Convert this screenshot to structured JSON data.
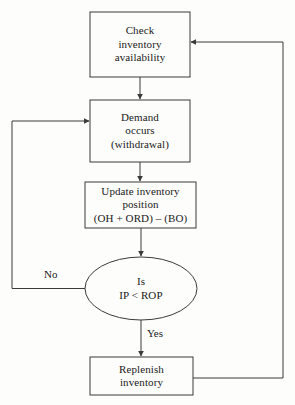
{
  "diagram": {
    "type": "flowchart",
    "background_color": "#fdfdfb",
    "line_color": "#3a3a3a",
    "text_color": "#1a1a1a",
    "nodes": [
      {
        "id": "check",
        "shape": "rectangle",
        "lines": [
          "Check",
          "inventory",
          "availability"
        ]
      },
      {
        "id": "demand",
        "shape": "rectangle",
        "lines": [
          "Demand",
          "occurs",
          "(withdrawal)"
        ]
      },
      {
        "id": "update",
        "shape": "rectangle",
        "lines": [
          "Update inventory",
          "position",
          "(OH + ORD) – (BO)"
        ]
      },
      {
        "id": "decision",
        "shape": "ellipse",
        "lines": [
          "Is",
          "IP < ROP"
        ]
      },
      {
        "id": "replenish",
        "shape": "rectangle",
        "lines": [
          "Replenish",
          "inventory"
        ]
      }
    ],
    "edge_labels": {
      "no": "No",
      "yes": "Yes"
    }
  }
}
